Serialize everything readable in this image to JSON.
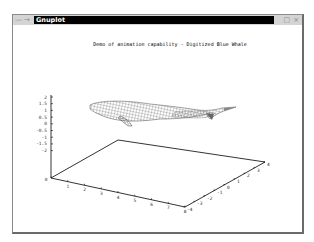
{
  "window": {
    "title": "Gnuplot",
    "controls": {
      "menu": "—",
      "arrow": "→",
      "maximize": "□",
      "close": "×"
    }
  },
  "chart_data": {
    "type": "surface3d",
    "title": "Demo of animation capability - Digitized Blue Whale",
    "xlabel": "",
    "ylabel": "",
    "zlabel": "",
    "x_ticks": [
      "0",
      "1",
      "2",
      "3",
      "4",
      "5",
      "6",
      "7",
      "8"
    ],
    "y_ticks": [
      "-4",
      "-3",
      "-2",
      "-1",
      "0",
      "1",
      "2",
      "3",
      "4"
    ],
    "z_ticks": [
      "2",
      "1.5",
      "1",
      "0.5",
      "0",
      "-0.5",
      "-1",
      "-1.5",
      "-2"
    ],
    "xlim": [
      0,
      8
    ],
    "ylim": [
      -4,
      4
    ],
    "zlim": [
      -2,
      2
    ],
    "grid": false,
    "legend": "none",
    "series": [
      {
        "name": "Digitized Blue Whale",
        "style": "wireframe mesh"
      }
    ]
  },
  "colors": {
    "mesh": "#555555",
    "axis": "#000000",
    "titlebar": "#000000",
    "frame": "#d4d4d4"
  }
}
